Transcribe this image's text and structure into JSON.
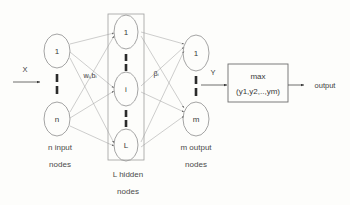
{
  "figure": {
    "background_color": "#fdfdfb",
    "stroke_color": "#9a9a9a",
    "text_color": "#3a3a3a"
  },
  "input_layer": {
    "caption_line1": "n input",
    "caption_line2": "nodes",
    "nodes": [
      {
        "label": "1"
      },
      {
        "label": "n"
      }
    ],
    "input_signal": "X"
  },
  "hidden_layer": {
    "caption_line1": "L  hidden",
    "caption_line2": "nodes",
    "nodes": [
      {
        "label": "1"
      },
      {
        "label": "i"
      },
      {
        "label": "L"
      }
    ]
  },
  "output_layer": {
    "caption_line1": "m output",
    "caption_line2": "nodes",
    "nodes": [
      {
        "label": "1"
      },
      {
        "label": "m"
      }
    ],
    "output_signal": "Y"
  },
  "weights": {
    "input_to_hidden": "wᵢ,bᵢ",
    "hidden_to_output": "βᵢ"
  },
  "decision_block": {
    "line1": "max",
    "line2": "(y1,y2,..,ym)"
  },
  "final_output": {
    "label": "output"
  }
}
